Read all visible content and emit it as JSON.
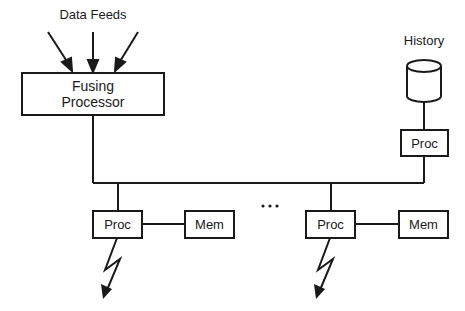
{
  "diagram": {
    "inputs_label": "Data Feeds",
    "fusing_processor": {
      "line1": "Fusing",
      "line2": "Processor"
    },
    "history": {
      "label": "History",
      "proc_label": "Proc"
    },
    "nodes": [
      {
        "proc_label": "Proc",
        "mem_label": "Mem"
      },
      {
        "proc_label": "Proc",
        "mem_label": "Mem"
      }
    ],
    "ellipsis": "• • •"
  }
}
